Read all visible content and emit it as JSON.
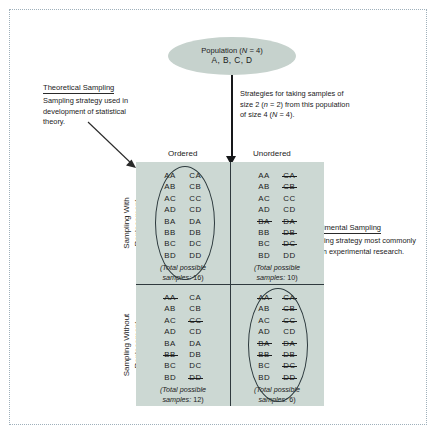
{
  "diagram": {
    "population": {
      "line1": "Population (N = 4)",
      "line1_plain": "Population (",
      "line1_italic": "N",
      "line1_tail": " = 4)",
      "line2": "A, B, C, D"
    },
    "strategies_note": "Strategies for taking samples of size 2 (n = 2) from this population of size 4 (N = 4).",
    "strategies_note_parts": {
      "t1": "Strategies for taking samples of size 2 (",
      "i1": "n",
      "t2": " = 2) from this population of size 4 (",
      "i2": "N",
      "t3": " = 4)."
    },
    "callouts": [
      {
        "id": "theoretical",
        "title": "Theoretical Sampling",
        "body": "Sampling strategy used in development of statistical theory."
      },
      {
        "id": "experimental",
        "title": "Experimental Sampling",
        "body": "Sampling strategy most commonly used in experimental research."
      }
    ],
    "column_headers": [
      "Ordered",
      "Unordered"
    ],
    "row_headers": [
      {
        "line1": "Sampling With",
        "line2": "Replacement"
      },
      {
        "line1": "Sampling Without",
        "line2": "Replacement"
      }
    ],
    "total_label_prefix": "(Total possible",
    "total_label_suffix": "samples: ",
    "cells": {
      "with_ordered": {
        "name": "Sampling With Replacement / Ordered",
        "circled": true,
        "total": 16,
        "total_text": "16)",
        "col1": [
          {
            "text": "AA",
            "struck": false
          },
          {
            "text": "AB",
            "struck": false
          },
          {
            "text": "AC",
            "struck": false
          },
          {
            "text": "AD",
            "struck": false
          },
          {
            "text": "BA",
            "struck": false
          },
          {
            "text": "BB",
            "struck": false
          },
          {
            "text": "BC",
            "struck": false
          },
          {
            "text": "BD",
            "struck": false
          }
        ],
        "col2": [
          {
            "text": "CA",
            "struck": false
          },
          {
            "text": "CB",
            "struck": false
          },
          {
            "text": "CC",
            "struck": false
          },
          {
            "text": "CD",
            "struck": false
          },
          {
            "text": "DA",
            "struck": false
          },
          {
            "text": "DB",
            "struck": false
          },
          {
            "text": "DC",
            "struck": false
          },
          {
            "text": "DD",
            "struck": false
          }
        ]
      },
      "with_unordered": {
        "name": "Sampling With Replacement / Unordered",
        "circled": false,
        "total": 10,
        "total_text": "10)",
        "col1": [
          {
            "text": "AA",
            "struck": false
          },
          {
            "text": "AB",
            "struck": false
          },
          {
            "text": "AC",
            "struck": false
          },
          {
            "text": "AD",
            "struck": false
          },
          {
            "text": "BA",
            "struck": true
          },
          {
            "text": "BB",
            "struck": false
          },
          {
            "text": "BC",
            "struck": false
          },
          {
            "text": "BD",
            "struck": false
          }
        ],
        "col2": [
          {
            "text": "CA",
            "struck": true
          },
          {
            "text": "CB",
            "struck": true
          },
          {
            "text": "CC",
            "struck": false
          },
          {
            "text": "CD",
            "struck": false
          },
          {
            "text": "DA",
            "struck": true
          },
          {
            "text": "DB",
            "struck": true
          },
          {
            "text": "DC",
            "struck": true
          },
          {
            "text": "DD",
            "struck": false
          }
        ]
      },
      "without_ordered": {
        "name": "Sampling Without Replacement / Ordered",
        "circled": false,
        "total": 12,
        "total_text": "12)",
        "col1": [
          {
            "text": "AA",
            "struck": true
          },
          {
            "text": "AB",
            "struck": false
          },
          {
            "text": "AC",
            "struck": false
          },
          {
            "text": "AD",
            "struck": false
          },
          {
            "text": "BA",
            "struck": false
          },
          {
            "text": "BB",
            "struck": true
          },
          {
            "text": "BC",
            "struck": false
          },
          {
            "text": "BD",
            "struck": false
          }
        ],
        "col2": [
          {
            "text": "CA",
            "struck": false
          },
          {
            "text": "CB",
            "struck": false
          },
          {
            "text": "CC",
            "struck": true
          },
          {
            "text": "CD",
            "struck": false
          },
          {
            "text": "DA",
            "struck": false
          },
          {
            "text": "DB",
            "struck": false
          },
          {
            "text": "DC",
            "struck": false
          },
          {
            "text": "DD",
            "struck": true
          }
        ]
      },
      "without_unordered": {
        "name": "Sampling Without Replacement / Unordered",
        "circled": true,
        "total": 6,
        "total_text": "6)",
        "col1": [
          {
            "text": "AA",
            "struck": true
          },
          {
            "text": "AB",
            "struck": false
          },
          {
            "text": "AC",
            "struck": false
          },
          {
            "text": "AD",
            "struck": false
          },
          {
            "text": "BA",
            "struck": true
          },
          {
            "text": "BB",
            "struck": true
          },
          {
            "text": "BC",
            "struck": false
          },
          {
            "text": "BD",
            "struck": false
          }
        ],
        "col2": [
          {
            "text": "CA",
            "struck": true
          },
          {
            "text": "CB",
            "struck": true
          },
          {
            "text": "CC",
            "struck": true
          },
          {
            "text": "CD",
            "struck": false
          },
          {
            "text": "DA",
            "struck": true
          },
          {
            "text": "DB",
            "struck": true
          },
          {
            "text": "DC",
            "struck": true
          },
          {
            "text": "DD",
            "struck": true
          }
        ]
      }
    },
    "colors": {
      "matrix_fill": "#ccd8d3",
      "ellipse_fill": "#c6d2cd",
      "line": "#2f3a3e",
      "frame": "#9fb0bb",
      "text": "#1b1b1b"
    }
  }
}
